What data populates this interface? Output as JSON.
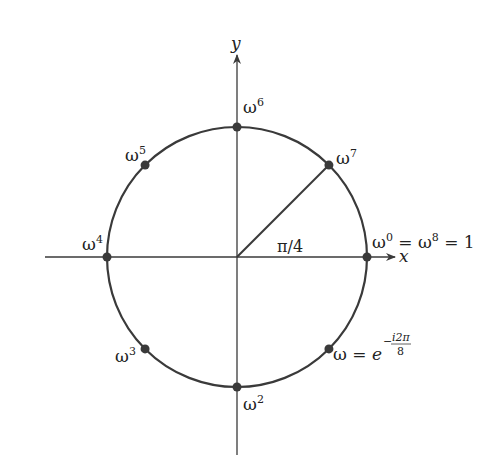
{
  "diagram": {
    "axes": {
      "x_label": "x",
      "y_label": "y"
    },
    "angle_label": "π/4",
    "colors": {
      "stroke": "#3a3a3a",
      "point": "#3a3a3a",
      "text": "#222222"
    },
    "points": [
      {
        "k": 0,
        "angle_deg": 0,
        "base": "ω",
        "sup": "0",
        "suffix": " = ω",
        "suffix_sup": "8",
        "tail": " = 1"
      },
      {
        "k": 1,
        "angle_deg": -45,
        "base": "ω",
        "sup": "",
        "eq": " = e",
        "exp_num": "i2π",
        "exp_den": "8",
        "exp_sign": "−"
      },
      {
        "k": 2,
        "angle_deg": -90,
        "base": "ω",
        "sup": "2"
      },
      {
        "k": 3,
        "angle_deg": -135,
        "base": "ω",
        "sup": "3"
      },
      {
        "k": 4,
        "angle_deg": 180,
        "base": "ω",
        "sup": "4"
      },
      {
        "k": 5,
        "angle_deg": 135,
        "base": "ω",
        "sup": "5"
      },
      {
        "k": 6,
        "angle_deg": 90,
        "base": "ω",
        "sup": "6"
      },
      {
        "k": 7,
        "angle_deg": 45,
        "base": "ω",
        "sup": "7"
      }
    ]
  }
}
